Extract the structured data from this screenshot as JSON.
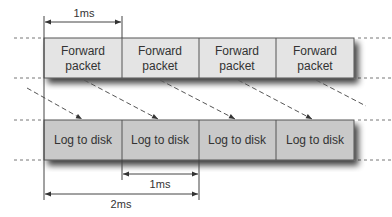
{
  "diagram": {
    "top_row": {
      "label_line1": "Forward",
      "label_line2": "packet",
      "fill": "#e4e4e4",
      "boxes": [
        {
          "line1": "Forward",
          "line2": "packet"
        },
        {
          "line1": "Forward",
          "line2": "packet"
        },
        {
          "line1": "Forward",
          "line2": "packet"
        },
        {
          "line1": "Forward",
          "line2": "packet"
        }
      ]
    },
    "bottom_row": {
      "fill": "#c9c9c9",
      "boxes": [
        {
          "label": "Log to disk"
        },
        {
          "label": "Log to disk"
        },
        {
          "label": "Log to disk"
        },
        {
          "label": "Log to disk"
        }
      ]
    },
    "dimensions": {
      "top": "1ms",
      "bottom_short": "1ms",
      "bottom_long": "2ms"
    },
    "stroke_color": "#555555"
  }
}
